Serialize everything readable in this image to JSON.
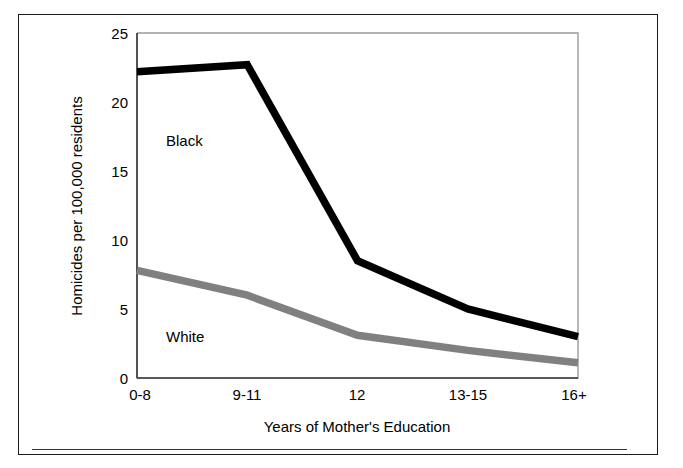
{
  "figure": {
    "frame_color": "#1a1a1a",
    "background": "#ffffff",
    "rule_color": "#333333"
  },
  "chart_data": {
    "type": "line",
    "title": "",
    "xlabel": "Years of Mother's Education",
    "ylabel": "Homicides per 100,000 residents",
    "categories": [
      "0-8",
      "9-11",
      "12",
      "13-15",
      "16+"
    ],
    "ylim": [
      0,
      25
    ],
    "yticks": [
      0,
      5,
      10,
      15,
      20,
      25
    ],
    "ytick_labels": [
      "0",
      "5",
      "10",
      "15",
      "20",
      "25"
    ],
    "grid": false,
    "legend": "inline-labels",
    "series": [
      {
        "name": "Black",
        "color": "#000000",
        "values": [
          22.2,
          22.7,
          8.5,
          5.0,
          3.0
        ],
        "label_position": "upper-left"
      },
      {
        "name": "White",
        "color": "#808080",
        "values": [
          7.8,
          6.0,
          3.1,
          2.0,
          1.1
        ],
        "label_position": "lower-left"
      }
    ]
  },
  "axes": {
    "y_ticks": [
      {
        "label": "25",
        "value": 25
      },
      {
        "label": "20",
        "value": 20
      },
      {
        "label": "15",
        "value": 15
      },
      {
        "label": "10",
        "value": 10
      },
      {
        "label": "5",
        "value": 5
      },
      {
        "label": "0",
        "value": 0
      }
    ],
    "x_ticks": [
      {
        "label": "0-8"
      },
      {
        "label": "9-11"
      },
      {
        "label": "12"
      },
      {
        "label": "13-15"
      },
      {
        "label": "16+"
      }
    ],
    "y_title": "Homicides per 100,000 residents",
    "x_title": "Years of Mother's Education"
  },
  "series_labels": {
    "black": "Black",
    "white": "White"
  }
}
